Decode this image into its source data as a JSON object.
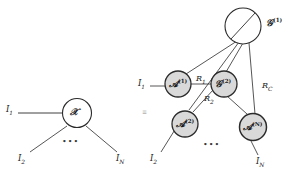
{
  "figure": {
    "type": "tensor-network-diagram",
    "caption_equivalence": "≡",
    "left": {
      "node": {
        "name": "script-X",
        "base": "𝒳",
        "superscript": "",
        "fill": "#ffffff",
        "stroke": "#2b2b2b"
      },
      "legs": [
        {
          "label_base": "I",
          "label_sub": "1",
          "position": "left"
        },
        {
          "label_base": "I",
          "label_sub": "2",
          "position": "bottom-left"
        },
        {
          "label_base": "I",
          "label_sub": "N",
          "position": "bottom-right"
        }
      ],
      "ellipsis": "•••"
    },
    "right": {
      "core_nodes": [
        {
          "id": "G1",
          "base": "𝒢",
          "superscript": "(1)",
          "fill": "#ffffff",
          "stroke": "#2b2b2b",
          "label_outside": true,
          "has_diagonal": true
        },
        {
          "id": "G2",
          "base": "𝒢",
          "superscript": "(2)",
          "fill": "#d9d9d9",
          "stroke": "#2b2b2b",
          "label_outside": false,
          "has_diagonal": false
        }
      ],
      "factor_nodes": [
        {
          "id": "A1",
          "base": "𝒜",
          "superscript": "(1)",
          "fill": "#d9d9d9",
          "stroke": "#2b2b2b"
        },
        {
          "id": "A2",
          "base": "𝒜",
          "superscript": "(2)",
          "fill": "#d9d9d9",
          "stroke": "#2b2b2b"
        },
        {
          "id": "AN",
          "base": "𝒜",
          "superscript": "(N)",
          "fill": "#d9d9d9",
          "stroke": "#2b2b2b"
        }
      ],
      "rank_labels": [
        {
          "id": "R1",
          "base": "R",
          "subscript": "1"
        },
        {
          "id": "R2",
          "base": "R",
          "subscript": "2"
        },
        {
          "id": "RC",
          "base": "R",
          "subscript": "C"
        }
      ],
      "legs": [
        {
          "label_base": "I",
          "label_sub": "1",
          "attached_to": "A1"
        },
        {
          "label_base": "I",
          "label_sub": "2",
          "attached_to": "A2"
        },
        {
          "label_base": "I",
          "label_sub": "N",
          "attached_to": "AN"
        }
      ],
      "ellipsis": "•••"
    },
    "colors": {
      "stroke": "#2b2b2b",
      "node_shaded_fill": "#d9d9d9",
      "node_open_fill": "#ffffff",
      "text": "#1a1a1a",
      "background": "#ffffff"
    }
  }
}
